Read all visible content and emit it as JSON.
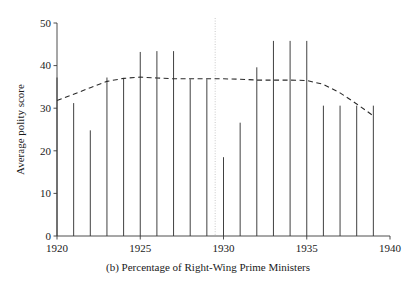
{
  "figure": {
    "caption": "(b) Percentage of Right-Wing Prime Ministers",
    "background_color": "#ffffff",
    "line_color": "#2b2b2b",
    "vline_color": "#c9c9c9"
  },
  "chart_data": {
    "type": "bar",
    "title": "",
    "subtitle": "",
    "caption": "(b) Percentage of Right-Wing Prime Ministers",
    "xlabel": "",
    "ylabel": "Average polity score",
    "xlim": [
      1920,
      1940
    ],
    "ylim": [
      0,
      50
    ],
    "xticks": [
      1920,
      1925,
      1930,
      1935,
      1940
    ],
    "xtick_labels": [
      "1920",
      "1925",
      "1930",
      "1935",
      "1940"
    ],
    "yticks": [
      0,
      10,
      20,
      30,
      40,
      50
    ],
    "ytick_labels": [
      "0",
      "10",
      "20",
      "30",
      "40",
      "50"
    ],
    "grid": false,
    "legend": null,
    "bar_style": "thin-spike",
    "categories": [
      1920,
      1921,
      1922,
      1923,
      1924,
      1925,
      1926,
      1927,
      1928,
      1929,
      1930,
      1931,
      1932,
      1933,
      1934,
      1935,
      1936,
      1937,
      1938,
      1939
    ],
    "values": [
      37.2,
      31.2,
      24.8,
      37.2,
      37.0,
      43.2,
      43.4,
      43.4,
      36.8,
      36.8,
      18.5,
      26.6,
      39.6,
      45.8,
      45.8,
      45.8,
      30.6,
      30.6,
      30.6,
      30.6
    ],
    "series": [
      {
        "name": "Average polity score",
        "type": "bar",
        "values": [
          37.2,
          31.2,
          24.8,
          37.2,
          37.0,
          43.2,
          43.4,
          43.4,
          36.8,
          36.8,
          18.5,
          26.6,
          39.6,
          45.8,
          45.8,
          45.8,
          30.6,
          30.6,
          30.6,
          30.6
        ]
      },
      {
        "name": "Smoothed trend",
        "type": "line",
        "style": "dashed",
        "x": [
          1920,
          1921,
          1922,
          1923,
          1924,
          1925,
          1926,
          1927,
          1928,
          1929,
          1930,
          1931,
          1932,
          1933,
          1934,
          1935,
          1936,
          1937,
          1938,
          1939
        ],
        "values": [
          31.8,
          33.3,
          34.8,
          36.3,
          37.0,
          37.3,
          37.1,
          36.9,
          36.9,
          36.9,
          36.9,
          36.8,
          36.6,
          36.6,
          36.6,
          36.5,
          35.6,
          33.6,
          31.0,
          28.2
        ]
      }
    ],
    "annotations": [
      {
        "type": "vertical-line",
        "x": 1929.5,
        "style": "dotted",
        "color": "#c9c9c9",
        "label": ""
      }
    ]
  }
}
